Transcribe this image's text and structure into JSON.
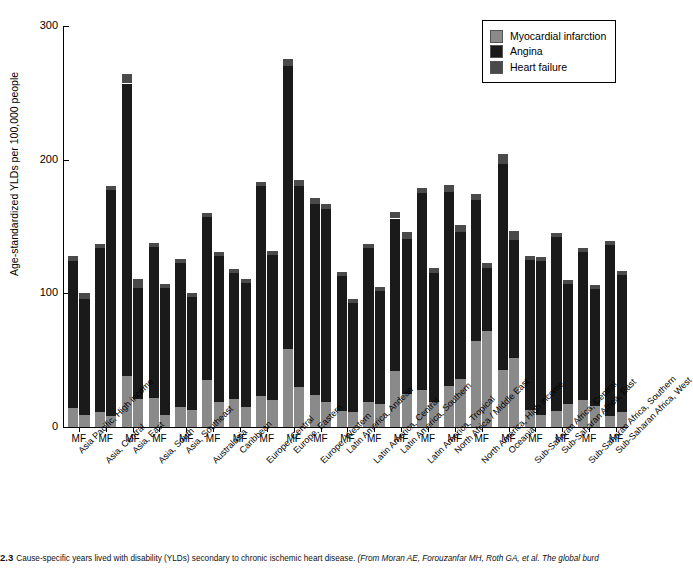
{
  "figure": {
    "number": "2.3",
    "caption_main": "Cause-specific years lived with disability (YLDs) secondary to chronic ischemic heart disease.",
    "caption_source": "(From Moran AE, Forouzanfar MH, Roth GA, et al. The global burd"
  },
  "legend": {
    "position": "top-right",
    "items": [
      {
        "label": "Myocardial infarction",
        "color": "#8a8a8a"
      },
      {
        "label": "Angina",
        "color": "#1a1a1a"
      },
      {
        "label": "Heart failure",
        "color": "#4a4a4a"
      }
    ]
  },
  "axes": {
    "ylabel": "Age-standardized YLDs per 100,000 people",
    "yticks": [
      0,
      100,
      200,
      300
    ],
    "ylim": [
      0,
      300
    ],
    "sex_label": "MF"
  },
  "chart_data": {
    "type": "bar",
    "title": "",
    "xlabel": "",
    "ylabel": "Age-standardized YLDs per 100,000 people",
    "ylim": [
      0,
      300
    ],
    "grid": false,
    "stacked": true,
    "legend_position": "top-right",
    "subgroups": [
      "M",
      "F"
    ],
    "categories": [
      "Asia Pacific, High income",
      "Asia, Central",
      "Asia, East",
      "Asia, South",
      "Asia, Southeast",
      "Australasia",
      "Caribbean",
      "Europe, Central",
      "Europe, Eastern",
      "Europe, Western",
      "Latin America, Andean",
      "Latin America, Central",
      "Latin America, Southern",
      "Latin America, Tropical",
      "North Africa / Middle East",
      "North America, High income",
      "Oceania",
      "Sub-Saharan Africa, Central",
      "Sub-Saharan Africa, East",
      "Sub-Saharan Africa, Southern",
      "Sub-Saharan Africa, West"
    ],
    "series": [
      {
        "name": "Myocardial infarction",
        "color": "#8a8a8a",
        "values_male": [
          14,
          11,
          38,
          22,
          15,
          35,
          21,
          23,
          58,
          24,
          12,
          19,
          42,
          28,
          31,
          64,
          43,
          13,
          12,
          20,
          8
        ],
        "values_female": [
          9,
          8,
          21,
          9,
          13,
          19,
          15,
          20,
          30,
          19,
          11,
          17,
          25,
          19,
          36,
          72,
          52,
          9,
          17,
          16,
          11
        ]
      },
      {
        "name": "Angina",
        "color": "#1a1a1a",
        "values_male": [
          110,
          123,
          219,
          113,
          108,
          122,
          94,
          157,
          212,
          143,
          101,
          115,
          114,
          147,
          145,
          106,
          154,
          112,
          130,
          111,
          128
        ],
        "values_female": [
          87,
          169,
          83,
          95,
          84,
          109,
          93,
          109,
          150,
          144,
          82,
          85,
          116,
          96,
          110,
          47,
          88,
          115,
          90,
          87,
          103
        ]
      },
      {
        "name": "Heart failure",
        "color": "#4a4a4a",
        "values_male": [
          4,
          3,
          7,
          3,
          3,
          3,
          3,
          3,
          5,
          4,
          3,
          3,
          5,
          4,
          5,
          4,
          7,
          3,
          3,
          3,
          3
        ]
      }
    ],
    "totals_male": [
      128,
      137,
      264,
      138,
      126,
      160,
      118,
      183,
      275,
      171,
      116,
      137,
      161,
      179,
      181,
      174,
      204,
      128,
      145,
      134,
      139
    ],
    "totals_female": [
      99,
      180,
      107,
      107,
      99,
      131,
      111,
      132,
      184,
      166,
      96,
      105,
      145,
      118,
      149,
      125,
      144,
      127,
      110,
      106,
      117
    ]
  }
}
